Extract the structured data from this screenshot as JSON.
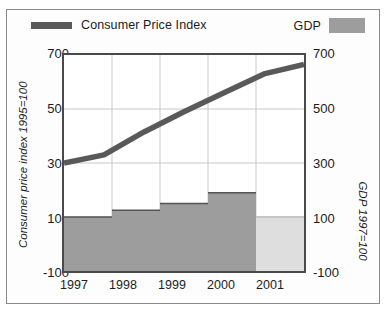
{
  "legend": {
    "cpi_label": "Consumer Price Index",
    "gdp_label": "GDP",
    "cpi_color": "#595959",
    "gdp_color": "#9d9d9d"
  },
  "axes": {
    "left_title": "Consumer price index 1995=100",
    "right_title": "GDP 1997=100",
    "yticks": [
      "700",
      "500",
      "300",
      "100",
      "-100"
    ],
    "xticks": [
      "1997",
      "1998",
      "1999",
      "2000",
      "2001"
    ]
  },
  "chart_data": {
    "type": "line",
    "title": "",
    "subtitle": "",
    "xlabel": "",
    "ylabel": "Consumer price index 1995=100",
    "ylabel_right": "GDP 1997=100",
    "categories": [
      "1997",
      "1998",
      "1999",
      "2000",
      "2001"
    ],
    "ylim": [
      -100,
      700
    ],
    "ytick_values": [
      700,
      500,
      300,
      100,
      -100
    ],
    "grid": true,
    "grid_axis": "y",
    "legend_position": "top",
    "series": [
      {
        "name": "Consumer Price Index",
        "type": "line",
        "axis": "left",
        "color": "#595959",
        "x": [
          "1996.5",
          "1997",
          "1998",
          "1999",
          "2000",
          "2001",
          "2001.5"
        ],
        "values": [
          300,
          330,
          415,
          490,
          560,
          630,
          665
        ]
      },
      {
        "name": "GDP",
        "type": "area-step",
        "axis": "right",
        "color": "#9d9d9d",
        "forecast_color": "#dedede",
        "categories": [
          "1997",
          "1998",
          "1999",
          "2000",
          "2001"
        ],
        "values": [
          100,
          125,
          150,
          190,
          100
        ],
        "forecast_flags": [
          false,
          false,
          false,
          false,
          true
        ]
      }
    ]
  }
}
